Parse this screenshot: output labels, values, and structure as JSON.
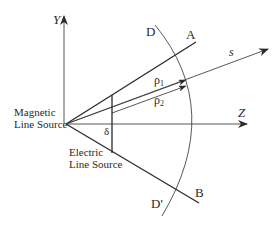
{
  "diagram": {
    "axes": {
      "y_label": "Y",
      "z_label": "Z"
    },
    "lines": {
      "a_label": "A",
      "b_label": "B",
      "s_label": "s"
    },
    "arc": {
      "top_label": "D",
      "bottom_label": "D'"
    },
    "distances": {
      "rho1_label": "ρ",
      "rho1_sub": "1",
      "rho2_label": "ρ",
      "rho2_sub": "2",
      "delta_label": "δ"
    },
    "sources": {
      "magnetic_line1": "Magnetic",
      "magnetic_line2": "Line Source",
      "electric_line1": "Electric",
      "electric_line2": "Line Source"
    },
    "colors": {
      "stroke": "#2a2a2a",
      "background": "#ffffff"
    }
  }
}
